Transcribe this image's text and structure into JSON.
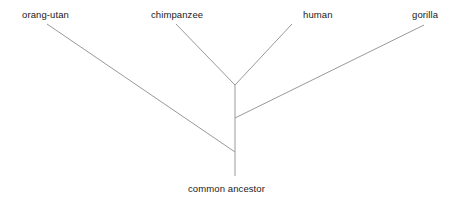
{
  "diagram": {
    "type": "phylogenetic-tree",
    "title": "",
    "background_color": "#ffffff",
    "line_color": "#999999",
    "text_color": "#1a1a1a",
    "line_width": 1,
    "taxa": [
      {
        "id": "orang-utan",
        "label": "orang-utan",
        "tip_x": 47,
        "tip_y": 24
      },
      {
        "id": "chimpanzee",
        "label": "chimpanzee",
        "tip_x": 176,
        "tip_y": 24
      },
      {
        "id": "human",
        "label": "human",
        "tip_x": 292,
        "tip_y": 24
      },
      {
        "id": "gorilla",
        "label": "gorilla",
        "tip_x": 424,
        "tip_y": 25
      }
    ],
    "root": {
      "id": "common-ancestor",
      "label": "common ancestor",
      "x": 235,
      "y": 176
    },
    "nodes": [
      {
        "id": "chimp-human-node",
        "x": 235,
        "y": 85,
        "children": [
          "chimpanzee",
          "human"
        ]
      },
      {
        "id": "gorilla-node",
        "x": 235,
        "y": 118,
        "children": [
          "chimp-human-node",
          "gorilla"
        ]
      },
      {
        "id": "orangutan-node",
        "x": 235,
        "y": 152,
        "children": [
          "gorilla-node",
          "orang-utan"
        ]
      }
    ],
    "branches": [
      {
        "from": "orang-utan",
        "to": "orangutan-node",
        "x1": 47,
        "y1": 24,
        "x2": 235,
        "y2": 152
      },
      {
        "from": "chimpanzee",
        "to": "chimp-human-node",
        "x1": 176,
        "y1": 24,
        "x2": 235,
        "y2": 85
      },
      {
        "from": "human",
        "to": "chimp-human-node",
        "x1": 292,
        "y1": 24,
        "x2": 235,
        "y2": 85
      },
      {
        "from": "gorilla",
        "to": "gorilla-node",
        "x1": 424,
        "y1": 25,
        "x2": 235,
        "y2": 118
      },
      {
        "from": "chimp-human-node",
        "to": "common-ancestor",
        "x1": 235,
        "y1": 85,
        "x2": 235,
        "y2": 176
      }
    ]
  }
}
